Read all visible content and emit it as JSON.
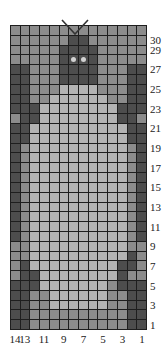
{
  "chart": {
    "title": "",
    "columns": 14,
    "rows": 31,
    "legend": {
      "M": "#8c8c8c",
      "D": "#4d4d4d",
      "L": "#b3b3b3",
      "eye": "#d2d2d2",
      "grid": "#1e1e1e"
    },
    "grid": [
      "MMMMMMMMMMMMMM",
      "MMMMMMDDMMMMMM",
      "MMMMMDDDDMMMMM",
      "MMMMMDEEDMMMMM",
      "DDMMMDDDDMMMDD",
      "DDMMMDDDDMMMDD",
      "DDMMMLLLLMMMDD",
      "DDMMLLLLLLMMDD",
      "DDDLLLLLLLLDDD",
      "MDDLLLLLLLLDDM",
      "DDLLLLLLLLLLDD",
      "DDLLLLLLLLLLDD",
      "DMLLLLLLLLLLMD",
      "DMLLLLLLLLLLMD",
      "DMLLLLLLLLLLMD",
      "DMLLLLLLLLLLMD",
      "DMLLLLLLLLLLMD",
      "DMLLLLLLLLLLMD",
      "DMLLLLLLLLLLMD",
      "DMLLLLLLLLLLMD",
      "DMLLLLLLLLLLMD",
      "DMLLLLLLLLLLMD",
      "MMLLLLLLLLLLMM",
      "MMLLLLLLLLLLDM",
      "MDLLLLLLLLLDDM",
      "MDDLLLLLLLLDMM",
      "DDDLLLLLLLMDDD",
      "DDMMLLLLLLMMDD",
      "DDMMLLLLLLMMDD",
      "DDMMMMMMMMMMDD",
      "DDMMMMMMMMMMDD"
    ],
    "row_labels": [
      {
        "text": "30",
        "row_index": 1
      },
      {
        "text": "29",
        "row_index": 2
      },
      {
        "text": "27",
        "row_index": 4
      },
      {
        "text": "25",
        "row_index": 6
      },
      {
        "text": "23",
        "row_index": 8
      },
      {
        "text": "21",
        "row_index": 10
      },
      {
        "text": "19",
        "row_index": 12
      },
      {
        "text": "17",
        "row_index": 14
      },
      {
        "text": "15",
        "row_index": 16
      },
      {
        "text": "13",
        "row_index": 18
      },
      {
        "text": "11",
        "row_index": 20
      },
      {
        "text": "9",
        "row_index": 22
      },
      {
        "text": "7",
        "row_index": 24
      },
      {
        "text": "5",
        "row_index": 26
      },
      {
        "text": "3",
        "row_index": 28
      },
      {
        "text": "1",
        "row_index": 30
      }
    ],
    "col_labels": [
      {
        "text": "14",
        "col_index": 0
      },
      {
        "text": "13",
        "col_index": 1
      },
      {
        "text": "11",
        "col_index": 3
      },
      {
        "text": "9",
        "col_index": 5
      },
      {
        "text": "7",
        "col_index": 7
      },
      {
        "text": "5",
        "col_index": 9
      },
      {
        "text": "3",
        "col_index": 11
      },
      {
        "text": "1",
        "col_index": 13
      }
    ]
  }
}
